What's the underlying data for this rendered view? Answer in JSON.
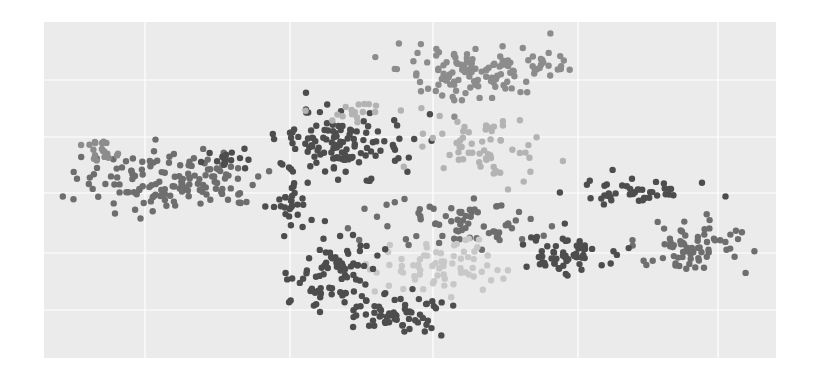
{
  "chart_data": {
    "type": "scatter",
    "title": "",
    "xlabel": "",
    "ylabel": "",
    "legend": [],
    "grid": true,
    "plot_area": {
      "x": 44,
      "y": 22,
      "width": 732,
      "height": 336,
      "background": "#ebebeb",
      "grid_color": "#ffffff"
    },
    "x_gridlines_px": [
      145,
      290,
      433,
      578,
      718
    ],
    "y_gridlines_px": [
      80,
      137,
      193,
      253,
      310
    ],
    "point_radius": 3.2,
    "shades": {
      "dark": "#4d4d4d",
      "mid": "#6e6e6e",
      "midlight": "#8c8c8c",
      "light": "#b3b3b3",
      "pale": "#c8c8c8"
    },
    "clusters": [
      {
        "name": "left-arm",
        "shade": "mid",
        "cx": 170,
        "cy": 180,
        "rx": 85,
        "ry": 28,
        "n": 140
      },
      {
        "name": "left-arm-tip",
        "shade": "midlight",
        "cx": 105,
        "cy": 152,
        "rx": 20,
        "ry": 15,
        "n": 20
      },
      {
        "name": "left-arm-dark",
        "shade": "dark",
        "cx": 225,
        "cy": 160,
        "rx": 25,
        "ry": 10,
        "n": 14
      },
      {
        "name": "upper-mid-dark",
        "shade": "dark",
        "cx": 340,
        "cy": 145,
        "rx": 60,
        "ry": 28,
        "n": 120
      },
      {
        "name": "upper-mid-pale",
        "shade": "light",
        "cx": 350,
        "cy": 112,
        "rx": 50,
        "ry": 8,
        "n": 18
      },
      {
        "name": "top-cluster",
        "shade": "midlight",
        "cx": 470,
        "cy": 70,
        "rx": 65,
        "ry": 26,
        "n": 110
      },
      {
        "name": "top-tail",
        "shade": "midlight",
        "cx": 545,
        "cy": 62,
        "rx": 30,
        "ry": 10,
        "n": 20
      },
      {
        "name": "center-upper-light",
        "shade": "light",
        "cx": 490,
        "cy": 150,
        "rx": 55,
        "ry": 30,
        "n": 60
      },
      {
        "name": "right-arm-dark",
        "shade": "dark",
        "cx": 630,
        "cy": 192,
        "rx": 55,
        "ry": 10,
        "n": 45
      },
      {
        "name": "right-lower-mid",
        "shade": "mid",
        "cx": 690,
        "cy": 245,
        "rx": 50,
        "ry": 25,
        "n": 70
      },
      {
        "name": "mid-lower-dark",
        "shade": "dark",
        "cx": 570,
        "cy": 255,
        "rx": 50,
        "ry": 20,
        "n": 60
      },
      {
        "name": "center-mid",
        "shade": "mid",
        "cx": 460,
        "cy": 225,
        "rx": 70,
        "ry": 25,
        "n": 70
      },
      {
        "name": "center-pale",
        "shade": "pale",
        "cx": 430,
        "cy": 265,
        "rx": 60,
        "ry": 25,
        "n": 70
      },
      {
        "name": "lower-left-dark",
        "shade": "dark",
        "cx": 335,
        "cy": 270,
        "rx": 40,
        "ry": 40,
        "n": 80
      },
      {
        "name": "bottom-dark",
        "shade": "dark",
        "cx": 400,
        "cy": 315,
        "rx": 45,
        "ry": 18,
        "n": 60
      },
      {
        "name": "vertical-dark",
        "shade": "dark",
        "cx": 290,
        "cy": 200,
        "rx": 15,
        "ry": 30,
        "n": 30
      }
    ]
  }
}
